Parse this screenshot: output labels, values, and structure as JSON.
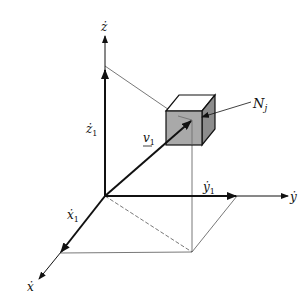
{
  "figure": {
    "type": "3d-coordinate-velocity-diagram",
    "axes": {
      "x": {
        "label": "ẋ",
        "component_label": "ẋ",
        "component_sub": "1"
      },
      "y": {
        "label": "ẏ",
        "component_label": "ẏ",
        "component_sub": "1"
      },
      "z": {
        "label": "ż",
        "component_label": "ż",
        "component_sub": "1"
      }
    },
    "vector": {
      "label": "v",
      "sub": "1",
      "underline": true
    },
    "element": {
      "label": "N",
      "sub": "j",
      "shape": "cube"
    },
    "colors": {
      "line": "#111111",
      "thin_line": "#444444",
      "cube_front": "#a9a9a9",
      "cube_side": "#8c8c8c",
      "cube_top": "#ffffff"
    }
  }
}
